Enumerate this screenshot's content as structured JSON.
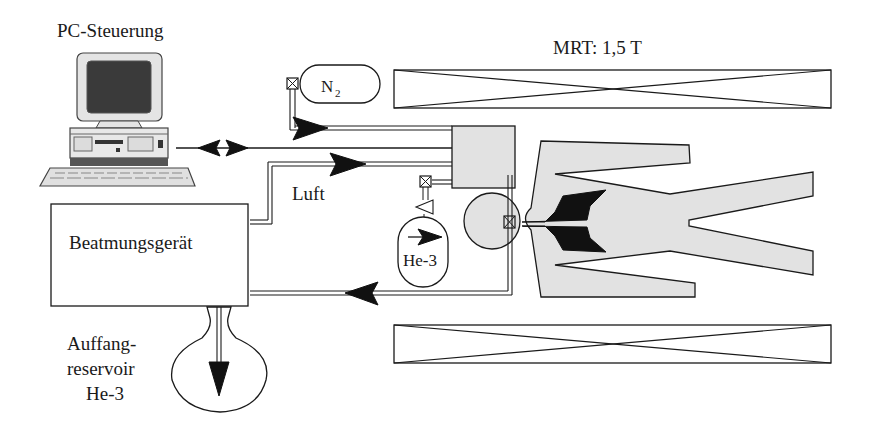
{
  "labels": {
    "pc": "PC-Steuerung",
    "mrt": "MRT: 1,5 T",
    "n2": "N",
    "n2_sub": "2",
    "luft": "Luft",
    "ventilator": "Beatmungsgerät",
    "he3_tank": "He-3",
    "reservoir_line1": "Auffang-",
    "reservoir_line2": "reservoir",
    "reservoir_line3": "He-3"
  },
  "components": [
    {
      "id": "pc",
      "label": "PC-Steuerung",
      "type": "computer"
    },
    {
      "id": "magnet-top",
      "label": "MRT: 1,5 T",
      "type": "magnet-coil"
    },
    {
      "id": "magnet-bottom",
      "type": "magnet-coil"
    },
    {
      "id": "n2-tank",
      "label": "N2",
      "type": "gas-cylinder"
    },
    {
      "id": "mixing-unit",
      "type": "box"
    },
    {
      "id": "he3-tank",
      "label": "He-3",
      "type": "gas-cylinder"
    },
    {
      "id": "ventilator",
      "label": "Beatmungsgerät",
      "type": "box"
    },
    {
      "id": "reservoir",
      "label": "Auffang-reservoir He-3",
      "type": "flask"
    },
    {
      "id": "patient",
      "type": "human-figure"
    }
  ],
  "connections": [
    {
      "from": "pc",
      "to": "mixing-unit",
      "direction": "bidirectional"
    },
    {
      "from": "n2-tank",
      "to": "mixing-unit"
    },
    {
      "from": "ventilator",
      "to": "mixing-unit",
      "label": "Luft"
    },
    {
      "from": "he3-tank",
      "to": "mixing-unit"
    },
    {
      "from": "patient",
      "to": "ventilator"
    },
    {
      "from": "ventilator",
      "to": "reservoir"
    }
  ],
  "colors": {
    "line": "#1a1a1a",
    "fill_gray": "#e2e2e2",
    "fill_black": "#111111",
    "background": "#ffffff"
  }
}
